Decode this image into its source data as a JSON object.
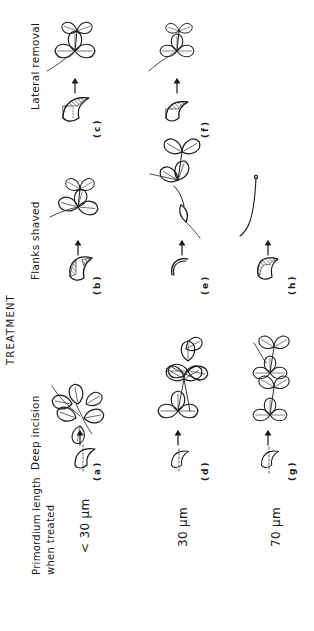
{
  "figure": {
    "row_header": {
      "line1": "Primordium length",
      "line2": "when treated"
    },
    "column_group_title": "TREATMENT",
    "columns": [
      {
        "id": "deep",
        "label": "Deep incision"
      },
      {
        "id": "flanks",
        "label": "Flanks shaved"
      },
      {
        "id": "lateral",
        "label": "Lateral removal"
      }
    ],
    "rows": [
      {
        "length_label": "< 30 μm",
        "panels": [
          "(a)",
          "(b)",
          "(c)"
        ]
      },
      {
        "length_label": "30 μm",
        "panels": [
          "(d)",
          "(e)",
          "(f)"
        ]
      },
      {
        "length_label": "70 μm",
        "panels": [
          "(g)",
          "(h)",
          ""
        ]
      }
    ],
    "orientation": "page rotated 90° counter-clockwise",
    "ink_color": "#1a1a1a",
    "background": "#ffffff"
  }
}
